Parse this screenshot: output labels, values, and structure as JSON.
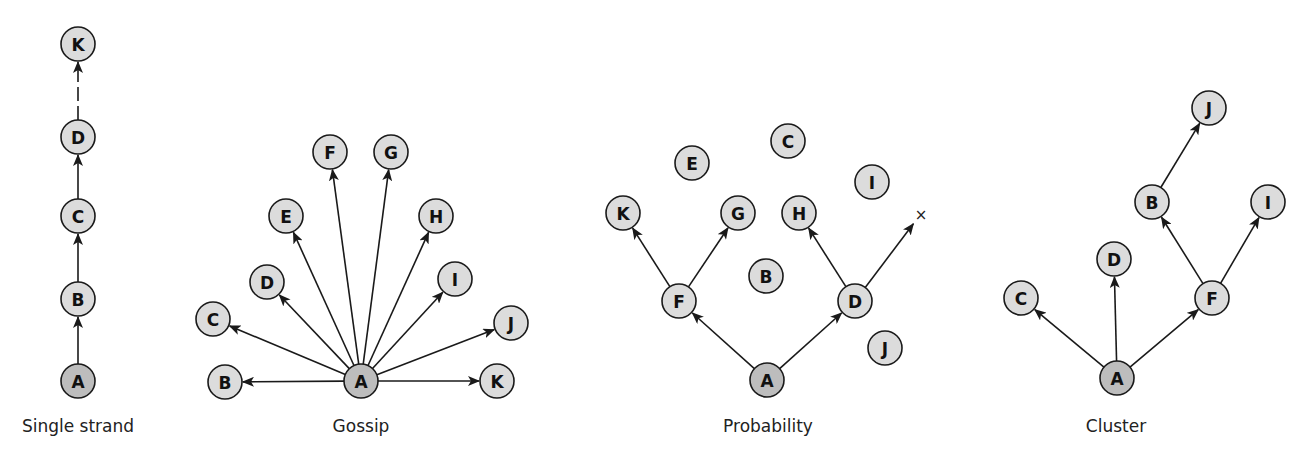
{
  "colors": {
    "node_fill": "#dcdcdc",
    "source_fill": "#bdbdbd",
    "stroke": "#1a1a1a",
    "background": "#ffffff"
  },
  "node_radius": 17,
  "diagrams": [
    {
      "id": "single-strand",
      "caption": "Single strand",
      "caption_pos": [
        78,
        432
      ],
      "source": "A",
      "nodes": [
        {
          "label": "K",
          "x": 78,
          "y": 44
        },
        {
          "label": "D",
          "x": 78,
          "y": 137
        },
        {
          "label": "C",
          "x": 78,
          "y": 216
        },
        {
          "label": "B",
          "x": 78,
          "y": 299
        },
        {
          "label": "A",
          "x": 78,
          "y": 381
        }
      ],
      "edges": [
        {
          "from": "A",
          "to": "B"
        },
        {
          "from": "B",
          "to": "C"
        },
        {
          "from": "C",
          "to": "D"
        },
        {
          "from": "D",
          "to": "K",
          "dashed": true
        }
      ]
    },
    {
      "id": "gossip",
      "caption": "Gossip",
      "caption_pos": [
        361,
        432
      ],
      "source": "A",
      "nodes": [
        {
          "label": "F",
          "x": 330,
          "y": 152
        },
        {
          "label": "G",
          "x": 391,
          "y": 152
        },
        {
          "label": "E",
          "x": 286,
          "y": 216
        },
        {
          "label": "H",
          "x": 436,
          "y": 216
        },
        {
          "label": "D",
          "x": 267,
          "y": 282
        },
        {
          "label": "I",
          "x": 455,
          "y": 279
        },
        {
          "label": "C",
          "x": 213,
          "y": 319
        },
        {
          "label": "J",
          "x": 511,
          "y": 323
        },
        {
          "label": "B",
          "x": 225,
          "y": 382
        },
        {
          "label": "A",
          "x": 361,
          "y": 381
        },
        {
          "label": "K",
          "x": 497,
          "y": 381
        }
      ],
      "edges": [
        {
          "from": "A",
          "to": "B"
        },
        {
          "from": "A",
          "to": "C"
        },
        {
          "from": "A",
          "to": "D"
        },
        {
          "from": "A",
          "to": "E"
        },
        {
          "from": "A",
          "to": "F"
        },
        {
          "from": "A",
          "to": "G"
        },
        {
          "from": "A",
          "to": "H"
        },
        {
          "from": "A",
          "to": "I"
        },
        {
          "from": "A",
          "to": "J"
        },
        {
          "from": "A",
          "to": "K"
        }
      ]
    },
    {
      "id": "probability",
      "caption": "Probability",
      "caption_pos": [
        768,
        432
      ],
      "source": "A",
      "nodes": [
        {
          "label": "C",
          "x": 788,
          "y": 141
        },
        {
          "label": "E",
          "x": 692,
          "y": 163
        },
        {
          "label": "I",
          "x": 872,
          "y": 182
        },
        {
          "label": "K",
          "x": 623,
          "y": 213
        },
        {
          "label": "G",
          "x": 738,
          "y": 213
        },
        {
          "label": "H",
          "x": 799,
          "y": 213
        },
        {
          "label": "B",
          "x": 766,
          "y": 276
        },
        {
          "label": "F",
          "x": 679,
          "y": 301
        },
        {
          "label": "D",
          "x": 855,
          "y": 301
        },
        {
          "label": "J",
          "x": 885,
          "y": 348
        },
        {
          "label": "A",
          "x": 767,
          "y": 380
        }
      ],
      "edges": [
        {
          "from": "A",
          "to": "F"
        },
        {
          "from": "A",
          "to": "D"
        },
        {
          "from": "F",
          "to": "K"
        },
        {
          "from": "F",
          "to": "G"
        },
        {
          "from": "D",
          "to": "H"
        },
        {
          "from": "D",
          "to": "X"
        }
      ],
      "dead_end": {
        "label": "×",
        "x": 917,
        "y": 219
      }
    },
    {
      "id": "cluster",
      "caption": "Cluster",
      "caption_pos": [
        1116,
        432
      ],
      "source": "A",
      "nodes": [
        {
          "label": "J",
          "x": 1209,
          "y": 108
        },
        {
          "label": "B",
          "x": 1152,
          "y": 202
        },
        {
          "label": "I",
          "x": 1268,
          "y": 202
        },
        {
          "label": "D",
          "x": 1114,
          "y": 259
        },
        {
          "label": "C",
          "x": 1021,
          "y": 298
        },
        {
          "label": "F",
          "x": 1212,
          "y": 298
        },
        {
          "label": "A",
          "x": 1117,
          "y": 378
        }
      ],
      "edges": [
        {
          "from": "A",
          "to": "C"
        },
        {
          "from": "A",
          "to": "D"
        },
        {
          "from": "A",
          "to": "F"
        },
        {
          "from": "F",
          "to": "B"
        },
        {
          "from": "F",
          "to": "I"
        },
        {
          "from": "B",
          "to": "J"
        }
      ]
    }
  ]
}
